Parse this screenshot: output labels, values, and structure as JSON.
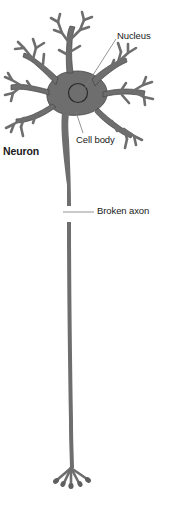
{
  "figure": {
    "title": "Neuron",
    "background_color": "#ffffff",
    "width": 171,
    "height": 522
  },
  "colors": {
    "cell_fill": "#6e6e6e",
    "cell_stroke": "#3f3f3f",
    "nucleus_stroke": "#2a2a2a",
    "axon": "#6e6e6e",
    "leader_line": "#6b6b6b",
    "label_text": "#1a1a1a"
  },
  "labels": {
    "nucleus": "Nucleus",
    "cell_body": "Cell body",
    "neuron": "Neuron",
    "broken_axon": "Broken axon"
  },
  "parts": [
    {
      "id": "dendrites",
      "name": "dendrites"
    },
    {
      "id": "cell-body",
      "name": "Cell body"
    },
    {
      "id": "nucleus",
      "name": "Nucleus"
    },
    {
      "id": "axon",
      "name": "Broken axon"
    },
    {
      "id": "axon-terminal",
      "name": "axon terminals"
    }
  ],
  "annotations": [
    {
      "label": "Nucleus",
      "leader": true,
      "style": "diagonal-line"
    },
    {
      "label": "Cell body",
      "leader": true,
      "style": "short-line"
    },
    {
      "label": "Neuron",
      "leader": false,
      "style": "bold-caption"
    },
    {
      "label": "Broken axon",
      "leader": true,
      "style": "horizontal-line"
    }
  ]
}
